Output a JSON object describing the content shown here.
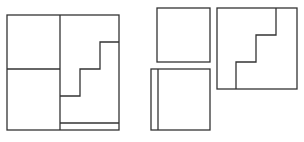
{
  "diagram": {
    "stroke_color": "#333333",
    "background": "#ffffff",
    "composite_figure": {
      "outer": {
        "x": 7,
        "y": 15,
        "w": 112,
        "h": 115
      },
      "lines": [
        {
          "x1": 60,
          "y1": 15,
          "x2": 60,
          "y2": 130
        },
        {
          "x1": 7,
          "y1": 69,
          "x2": 60,
          "y2": 69
        },
        {
          "x1": 60,
          "y1": 123,
          "x2": 119,
          "y2": 123
        }
      ],
      "stair_path": "M60,96 L80,96 L80,69 L100,69 L100,42 L119,42"
    },
    "pieces": [
      {
        "name": "small-square-top",
        "x": 157,
        "y": 8,
        "w": 53,
        "h": 54
      },
      {
        "name": "square-with-strip",
        "x": 151,
        "y": 69,
        "w": 59,
        "h": 61,
        "inner_line_x": 158
      },
      {
        "name": "stair-square",
        "x": 217,
        "y": 8,
        "w": 80,
        "h": 81,
        "stair_path": "M276,8 L276,35 L256,35 L256,62 L236,62 L236,89"
      }
    ]
  }
}
